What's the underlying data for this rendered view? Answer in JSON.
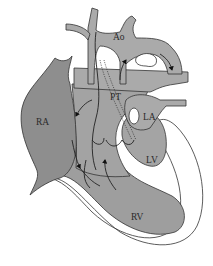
{
  "diagram": {
    "type": "heart-anatomy-schematic",
    "labels": {
      "aorta": "Ao",
      "pulmonary_trunk": "PT",
      "right_atrium": "RA",
      "left_atrium": "LA",
      "left_ventricle": "LV",
      "right_ventricle": "RV"
    },
    "colors": {
      "background": "#ffffff",
      "atrium_fill": "#8e8e8e",
      "vessel_fill": "#aaaaaa",
      "ventricle_fill": "#9c9c9c",
      "outline": "#333333",
      "wall": "#ffffff"
    },
    "flow_arrows": [
      "aortic-arch-flow",
      "ascending-aorta-flow",
      "right-atrium-inflow",
      "right-ventricle-inflow",
      "outflow-to-aorta"
    ]
  }
}
